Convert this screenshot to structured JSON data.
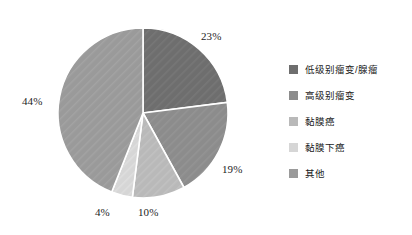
{
  "chart_data": {
    "type": "pie",
    "title": "",
    "legend_position": "right",
    "grid": false,
    "categories": [
      "低级别瘤变/腺瘤",
      "高级别瘤变",
      "黏膜癌",
      "黏膜下癌",
      "其他"
    ],
    "values": [
      23,
      19,
      10,
      4,
      44
    ],
    "value_labels": [
      "23%",
      "19%",
      "10%",
      "4%",
      "44%"
    ],
    "colors": [
      "#6e6e6e",
      "#8c8c8c",
      "#b9b9b9",
      "#d6d6d6",
      "#9a9a9a"
    ],
    "slice_start_angles": [
      0,
      82.8,
      151.2,
      187.2,
      201.6
    ],
    "slice_end_angles": [
      82.8,
      151.2,
      187.2,
      201.6,
      360
    ],
    "units": "percent",
    "xlabel": "",
    "ylabel": ""
  },
  "legend": {
    "items": [
      {
        "label": "低级别瘤变/腺瘤",
        "color": "#6e6e6e",
        "swatch_name": "legend-swatch-low-grade"
      },
      {
        "label": "高级别瘤变",
        "color": "#8c8c8c",
        "swatch_name": "legend-swatch-high-grade"
      },
      {
        "label": "黏膜癌",
        "color": "#b9b9b9",
        "swatch_name": "legend-swatch-mucosal-carcinoma"
      },
      {
        "label": "黏膜下癌",
        "color": "#d6d6d6",
        "swatch_name": "legend-swatch-submucosal-carcinoma"
      },
      {
        "label": "其他",
        "color": "#9a9a9a",
        "swatch_name": "legend-swatch-other"
      }
    ]
  },
  "pie": {
    "center_x": 143,
    "center_y": 113,
    "radius": 85,
    "slice_border_color": "#ffffff",
    "labels": [
      {
        "text": "23%",
        "name": "pie-label-23"
      },
      {
        "text": "19%",
        "name": "pie-label-19"
      },
      {
        "text": "10%",
        "name": "pie-label-10"
      },
      {
        "text": "4%",
        "name": "pie-label-4"
      },
      {
        "text": "44%",
        "name": "pie-label-44"
      }
    ]
  }
}
